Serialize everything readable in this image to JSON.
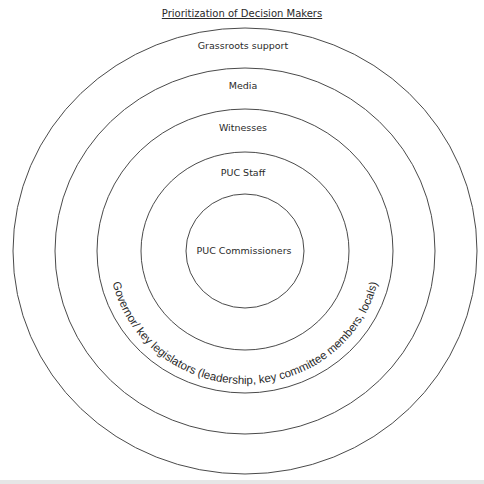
{
  "diagram": {
    "title": "Prioritization of Decision Makers",
    "rings": [
      {
        "level": 1,
        "label": "PUC Commissioners"
      },
      {
        "level": 2,
        "label": "PUC Staff"
      },
      {
        "level": 3,
        "label": "Witnesses"
      },
      {
        "level": 4,
        "label": "Media"
      },
      {
        "level": 5,
        "label": "Grassroots support"
      }
    ],
    "arc_label": "Governor/ key legislators (leadership, key committee members, locals)",
    "colors": {
      "stroke": "#4a4a4a",
      "text": "#2a2a2a",
      "background": "#ffffff"
    }
  }
}
